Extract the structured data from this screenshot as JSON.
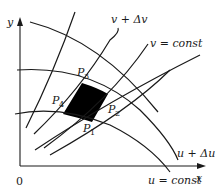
{
  "figure": {
    "axes": {
      "x_label": "x",
      "y_label": "y",
      "origin_label": "0"
    },
    "curve_labels": {
      "v_plus": "v + Δv",
      "v_const": "v = const",
      "u_plus": "u + Δu",
      "u_const": "u = const"
    },
    "points": [
      {
        "name": "P",
        "sub": "1"
      },
      {
        "name": "P",
        "sub": "2"
      },
      {
        "name": "P",
        "sub": "3"
      },
      {
        "name": "P",
        "sub": "4"
      }
    ],
    "fill_color": "#000000",
    "line_color": "#1a1a1a"
  }
}
